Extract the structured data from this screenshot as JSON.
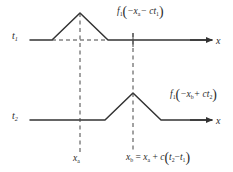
{
  "figure": {
    "ink_color": "#333333",
    "dash_color": "#444444",
    "background": "#ffffff"
  },
  "rows": [
    {
      "time_label": "t",
      "time_sub": "1",
      "axis_label": "x",
      "baseline_y": 40,
      "peak_x": 80,
      "peak_y": 13,
      "base_left_x": 52,
      "base_right_x": 108,
      "expression": {
        "fn": "f",
        "fn_sub": "1",
        "open": "(",
        "body": "−x",
        "body_sub": "a",
        "op": "− ct",
        "op_sub": "1",
        "close": ")"
      }
    },
    {
      "time_label": "t",
      "time_sub": "2",
      "axis_label": "x",
      "baseline_y": 120,
      "peak_x": 133,
      "peak_y": 93,
      "base_left_x": 105,
      "base_right_x": 161,
      "expression": {
        "fn": "f",
        "fn_sub": "1",
        "open": "(",
        "body": "−x",
        "body_sub": "b",
        "op": "+ ct",
        "op_sub": "2",
        "close": ")"
      }
    }
  ],
  "markers": [
    {
      "name": "x-a",
      "x": 80,
      "label": "x",
      "label_sub": "a"
    },
    {
      "name": "x-b",
      "x": 133,
      "label": "x",
      "label_sub": "b",
      "equation": {
        "lhs": "x",
        "lhs_sub": "b",
        "eq": "=",
        "rhs1": "x",
        "rhs1_sub": "a",
        "plus": "+",
        "c": "c",
        "open": "(",
        "t2": "t",
        "t2_sub": "2",
        "minus": "−",
        "t1": "t",
        "t1_sub": "1",
        "close": ")"
      }
    }
  ]
}
